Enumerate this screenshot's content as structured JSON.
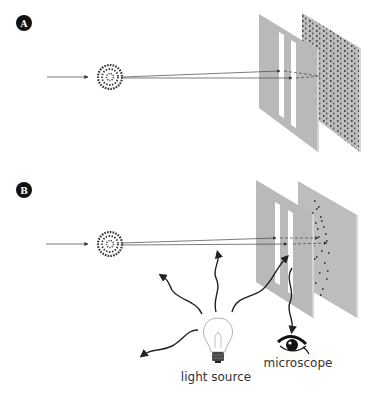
{
  "panels": [
    {
      "badge": "A",
      "description": "Electron beam through double slit, no observation - interference pattern"
    },
    {
      "badge": "B",
      "description": "Electron beam through double slit with light source and microscope observing - no interference"
    }
  ],
  "labels": {
    "light_source": "light source",
    "microscope": "microscope"
  },
  "colors": {
    "plate": "#b9b9b9",
    "plate_edge": "#d4d4d4",
    "badge": "#111111",
    "ink": "#222222",
    "slit": "#ffffff"
  }
}
